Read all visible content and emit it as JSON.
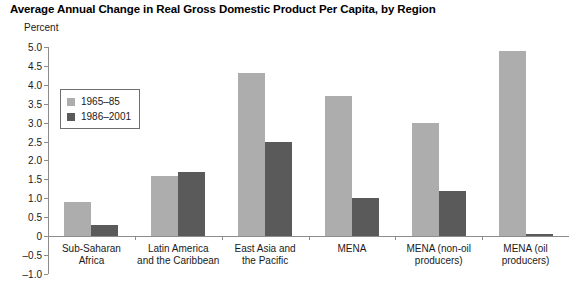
{
  "chart_data": {
    "type": "bar",
    "title": "Average Annual Change in Real Gross Domestic Product Per Capita, by Region",
    "subtitle": "",
    "ylabel": "Percent",
    "xlabel": "",
    "ylim": [
      -1.0,
      5.0
    ],
    "ytick_labels": [
      "5.0",
      "4.5",
      "4.0",
      "3.5",
      "3.0",
      "2.5",
      "2.0",
      "1.5",
      "1.0",
      "0.5",
      "0",
      "–0.5",
      "–1.0"
    ],
    "ytick_values": [
      5.0,
      4.5,
      4.0,
      3.5,
      3.0,
      2.5,
      2.0,
      1.5,
      1.0,
      0.5,
      0,
      -0.5,
      -1.0
    ],
    "grid": false,
    "legend_position": "upper-left-inside",
    "categories": [
      "Sub-Saharan\nAfrica",
      "Latin America\nand the Caribbean",
      "East Asia and\nthe Pacific",
      "MENA",
      "MENA (non-oil\nproducers)",
      "MENA (oil\nproducers)"
    ],
    "series": [
      {
        "name": "1965–85",
        "color": "#adadad",
        "values": [
          0.9,
          1.6,
          4.3,
          3.7,
          3.0,
          4.9
        ]
      },
      {
        "name": "1986–2001",
        "color": "#5a5a5a",
        "values": [
          0.3,
          1.7,
          2.5,
          1.0,
          1.2,
          0.05
        ]
      }
    ]
  },
  "colors": {
    "series_early": "#adadad",
    "series_late": "#5a5a5a",
    "axis": "#8c8c8c",
    "text": "#1a1a1a",
    "background": "#ffffff"
  }
}
